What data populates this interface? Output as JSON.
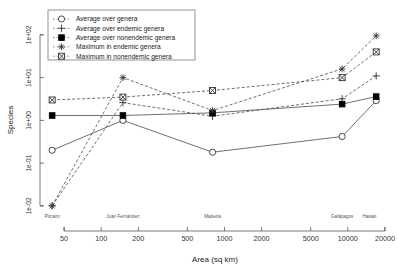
{
  "chart_data": {
    "type": "line",
    "title": "",
    "xlabel": "Area (sq km)",
    "ylabel": "Species",
    "xscale": "log",
    "yscale": "log",
    "xlim": [
      35,
      22000
    ],
    "ylim": [
      0.008,
      130
    ],
    "grid": false,
    "legend_position": "top-left",
    "xticks": [
      50,
      100,
      200,
      500,
      1000,
      2000,
      5000,
      10000,
      20000
    ],
    "xtick_labels": [
      "50",
      "100",
      "200",
      "500",
      "1000",
      "2000",
      "5000",
      "10000",
      "20000"
    ],
    "yticks": [
      0.01,
      0.1,
      1,
      10,
      100
    ],
    "ytick_labels": [
      "1e-02",
      "1e-01",
      "1e+00",
      "1e+01",
      "1e+02"
    ],
    "islands": [
      {
        "name": "Pitcairn",
        "area": 40
      },
      {
        "name": "Juan Fernández",
        "area": 150
      },
      {
        "name": "Madeira",
        "area": 800
      },
      {
        "name": "Galápagos",
        "area": 9000
      },
      {
        "name": "Hawaii",
        "area": 17000
      }
    ],
    "x": [
      40,
      150,
      800,
      9000,
      17000
    ],
    "series": [
      {
        "name": "Average over genera",
        "marker": "circle-open",
        "linestyle": "solid",
        "values": [
          0.2,
          1.0,
          0.18,
          0.42,
          2.9
        ]
      },
      {
        "name": "Average over endemic genera",
        "marker": "plus",
        "linestyle": "dashed",
        "values": [
          0.01,
          2.6,
          1.25,
          3.2,
          11.0
        ]
      },
      {
        "name": "Average over nonendemic genera",
        "marker": "square-filled",
        "linestyle": "solid",
        "values": [
          1.3,
          1.3,
          1.5,
          2.4,
          3.6
        ]
      },
      {
        "name": "Maximum in endemic genera",
        "marker": "asterisk",
        "linestyle": "dashed",
        "values": [
          0.01,
          10.0,
          1.7,
          16.0,
          95.0
        ]
      },
      {
        "name": "Maximum in nonendemic genera",
        "marker": "square-x",
        "linestyle": "dashed",
        "values": [
          3.0,
          3.5,
          5.0,
          10.0,
          40.0
        ]
      }
    ]
  },
  "legend": {
    "entries": [
      "Average over genera",
      "Average over endemic genera",
      "Average over nonendemic genera",
      "Maximum in endemic genera",
      "Maximum in nonendemic genera"
    ]
  },
  "colors": {
    "background": "#ffffff",
    "line": "#4a4a4a",
    "marker_fill_open": "#ffffff",
    "marker_fill_solid": "#000000",
    "text": "#1a1a1a",
    "axis": "#555555"
  }
}
